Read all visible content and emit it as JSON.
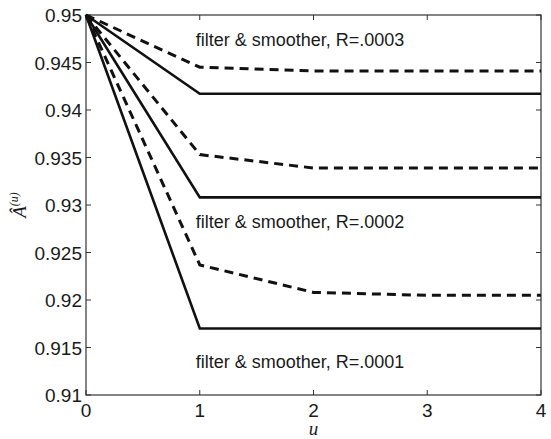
{
  "chart_data": {
    "type": "line",
    "title": "",
    "xlabel": "u",
    "ylabel": "Â(u)",
    "ylabel_base": "Â",
    "ylabel_sup": "(u)",
    "xlim": [
      0,
      4
    ],
    "ylim": [
      0.91,
      0.95
    ],
    "xticks": [
      0,
      1,
      2,
      3,
      4
    ],
    "xtick_labels": [
      "0",
      "1",
      "2",
      "3",
      "4"
    ],
    "yticks": [
      0.91,
      0.915,
      0.92,
      0.925,
      0.93,
      0.935,
      0.94,
      0.945,
      0.95
    ],
    "ytick_labels": [
      "0.91",
      "0.915",
      "0.92",
      "0.925",
      "0.93",
      "0.935",
      "0.94",
      "0.945",
      "0.95"
    ],
    "grid": false,
    "legend": null,
    "x": [
      0,
      1,
      2,
      3,
      4
    ],
    "series": [
      {
        "name": "filter R=.0003",
        "style": "solid",
        "color": "#111111",
        "values": [
          0.95,
          0.9417,
          0.9417,
          0.9417,
          0.9417
        ]
      },
      {
        "name": "smoother R=.0003",
        "style": "dashed",
        "color": "#111111",
        "values": [
          0.95,
          0.9445,
          0.9441,
          0.9441,
          0.9441
        ]
      },
      {
        "name": "filter R=.0002",
        "style": "solid",
        "color": "#111111",
        "values": [
          0.95,
          0.9308,
          0.9308,
          0.9308,
          0.9308
        ]
      },
      {
        "name": "smoother R=.0002",
        "style": "dashed",
        "color": "#111111",
        "values": [
          0.95,
          0.9353,
          0.9339,
          0.9339,
          0.9339
        ]
      },
      {
        "name": "filter R=.0001",
        "style": "solid",
        "color": "#111111",
        "values": [
          0.95,
          0.917,
          0.917,
          0.917,
          0.917
        ]
      },
      {
        "name": "smoother R=.0001",
        "style": "dashed",
        "color": "#111111",
        "values": [
          0.95,
          0.9237,
          0.9208,
          0.9205,
          0.9205
        ]
      }
    ],
    "annotations": [
      {
        "text": "filter & smoother, R=.0003",
        "x": 1.0,
        "y": 0.9467
      },
      {
        "text": "filter & smoother, R=.0002",
        "x": 1.0,
        "y": 0.9276
      },
      {
        "text": "filter & smoother, R=.0001",
        "x": 1.0,
        "y": 0.9128
      }
    ]
  }
}
